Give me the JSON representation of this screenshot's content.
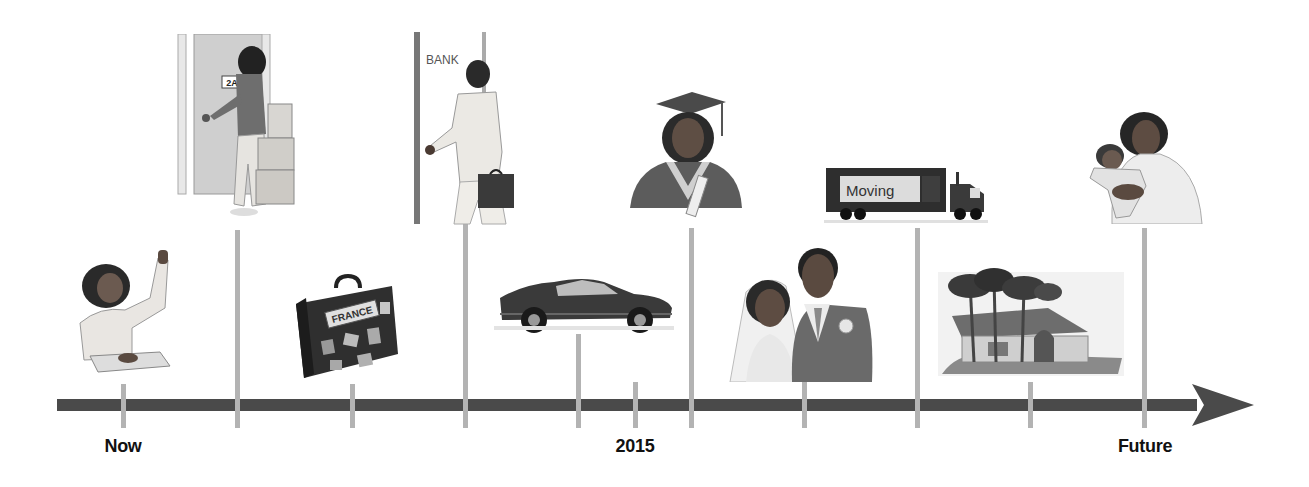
{
  "timeline": {
    "labels": {
      "start": "Now",
      "middle": "2015",
      "end": "Future"
    },
    "colors": {
      "axis": "#4a4a4a",
      "tick": "#b3b3b3",
      "label": "#111111"
    },
    "events": [
      {
        "name": "student-raising-hand",
        "position": "below",
        "tick_x": 123
      },
      {
        "name": "moving-into-apartment",
        "position": "above",
        "tick_x": 237,
        "sign_text": "2A"
      },
      {
        "name": "travel-to-france",
        "position": "below",
        "tick_x": 352,
        "sticker_text": "FRANCE"
      },
      {
        "name": "working-at-bank",
        "position": "above",
        "tick_x": 465,
        "sign_text": "BANK"
      },
      {
        "name": "buying-a-car",
        "position": "below",
        "tick_x": 578
      },
      {
        "name": "graduation",
        "position": "above",
        "tick_x": 691
      },
      {
        "name": "wedding",
        "position": "below",
        "tick_x": 804
      },
      {
        "name": "moving-truck",
        "position": "above",
        "tick_x": 917,
        "truck_text": "Moving"
      },
      {
        "name": "buying-a-house",
        "position": "below",
        "tick_x": 1030
      },
      {
        "name": "having-a-baby",
        "position": "above",
        "tick_x": 1144
      }
    ]
  }
}
